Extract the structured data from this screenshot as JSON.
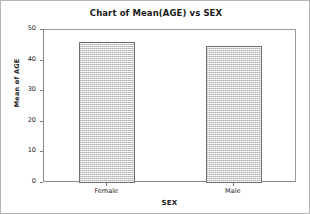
{
  "chart_data": {
    "type": "bar",
    "title": "Chart of Mean(AGE) vs SEX",
    "xlabel": "SEX",
    "ylabel": "Mean of AGE",
    "categories": [
      "Female",
      "Male"
    ],
    "values": [
      46.2,
      44.8
    ],
    "series": [
      {
        "name": "Mean of AGE",
        "values": [
          46.2,
          44.8
        ]
      }
    ],
    "ylim": [
      0,
      50
    ],
    "yticks": [
      0,
      10,
      20,
      30,
      40,
      50
    ],
    "ytick_labels": [
      "0",
      "10",
      "20",
      "30",
      "40",
      "50"
    ],
    "grid": false,
    "legend": false,
    "legend_position": "none",
    "bar_fill_color": "#cfcfcf",
    "bar_edge_color": "#6e6e6e",
    "axis_color": "#8a8a8a",
    "text_color": "#1a1a1a",
    "background_color": "#ffffff"
  }
}
